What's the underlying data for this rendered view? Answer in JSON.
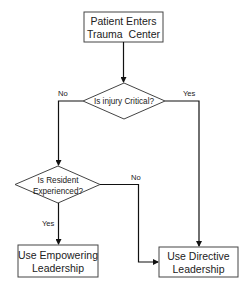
{
  "diagram": {
    "colors": {
      "stroke": "#333333",
      "line": "#111111",
      "text": "#222222",
      "background": "#ffffff"
    },
    "nodes": {
      "start": {
        "type": "process",
        "line1": "Patient Enters",
        "line2": "Trauma  Center"
      },
      "decision_critical": {
        "type": "decision",
        "line1": "Is injury Critical?"
      },
      "decision_experienced": {
        "type": "decision",
        "line1": "Is Resident",
        "line2": "Experienced?"
      },
      "empowering": {
        "type": "process",
        "line1": "Use Empowering",
        "line2": "Leadership"
      },
      "directive": {
        "type": "process",
        "line1": "Use Directive",
        "line2": "Leadership"
      }
    },
    "edges": [
      {
        "from": "start",
        "to": "decision_critical",
        "label": ""
      },
      {
        "from": "decision_critical",
        "to": "decision_experienced",
        "label": "No"
      },
      {
        "from": "decision_critical",
        "to": "directive",
        "label": "Yes"
      },
      {
        "from": "decision_experienced",
        "to": "empowering",
        "label": "Yes"
      },
      {
        "from": "decision_experienced",
        "to": "directive",
        "label": "No"
      }
    ],
    "labels": {
      "critical_no": "No",
      "critical_yes": "Yes",
      "experienced_yes": "Yes",
      "experienced_no": "No"
    }
  }
}
